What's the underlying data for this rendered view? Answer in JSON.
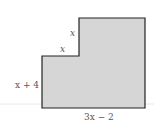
{
  "diagram": {
    "type": "L-shaped polygon",
    "fill_color": "#d6d6d6",
    "stroke_color": "#222222",
    "labels": {
      "upper_step_side": "x",
      "lower_step_side": "x",
      "left_side": "x + 4",
      "bottom_side": "3x − 2"
    }
  }
}
